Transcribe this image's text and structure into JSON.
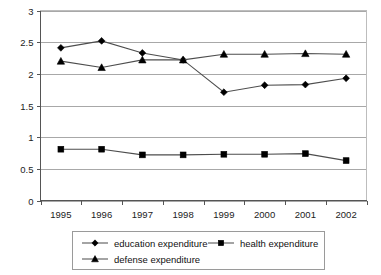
{
  "chart_data": {
    "type": "line",
    "title": "",
    "xlabel": "",
    "ylabel": "",
    "categories": [
      "1995",
      "1996",
      "1997",
      "1998",
      "1999",
      "2000",
      "2001",
      "2002"
    ],
    "ylim": [
      0,
      3
    ],
    "yticks": [
      "0",
      "0.5",
      "1",
      "1.5",
      "2",
      "2.5",
      "3"
    ],
    "ytick_values": [
      0,
      0.5,
      1,
      1.5,
      2,
      2.5,
      3
    ],
    "grid": "horizontal",
    "legend_position": "bottom",
    "series": [
      {
        "name": "education expenditure",
        "marker": "diamond",
        "values": [
          2.41,
          2.52,
          2.33,
          2.22,
          1.71,
          1.82,
          1.83,
          1.93
        ]
      },
      {
        "name": "health expenditure",
        "marker": "square",
        "values": [
          0.81,
          0.81,
          0.72,
          0.72,
          0.73,
          0.73,
          0.74,
          0.63
        ]
      },
      {
        "name": "defense expenditure",
        "marker": "triangle",
        "values": [
          2.2,
          2.1,
          2.22,
          2.22,
          2.31,
          2.31,
          2.32,
          2.31
        ]
      }
    ]
  },
  "colors": {
    "series_line": "#4d4d4d",
    "marker": "#000000",
    "gridline": "#a8a8a8",
    "axis": "#555555",
    "background": "#ffffff"
  }
}
